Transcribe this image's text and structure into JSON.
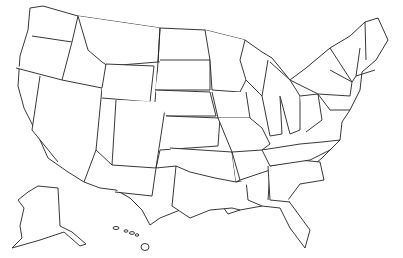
{
  "map": {
    "title": "United States map with shaded region",
    "subject": "Contiguous United States, Alaska and Hawaii",
    "colors": {
      "shaded": "#a8a8a8",
      "unshaded": "#ffffff",
      "border": "#222222",
      "background": "#ffffff"
    },
    "legend": "",
    "shaded_region_description": "Northern and western states shaded gray, including the Pacific Northwest, Rockies, northern Plains, Midwest and Northeast, extending south through Arizona/New Mexico into west Texas; the Southeast, Gulf Coast, southern California coast, Alaska and Hawaii are unshaded."
  }
}
